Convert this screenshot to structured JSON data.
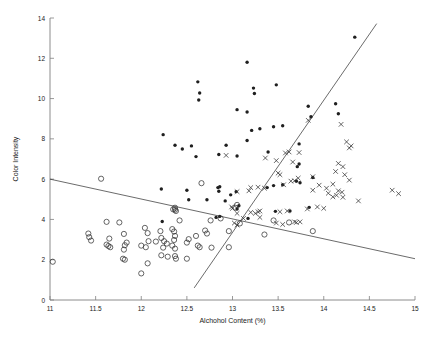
{
  "figure": {
    "background": "#ffffff",
    "axis_color": "#808080",
    "marker_color": "#333333"
  },
  "chart_data": {
    "type": "scatter",
    "title": "",
    "xlabel": "Alchohol Content (%)",
    "ylabel": "Color Intensity",
    "xlim": [
      11,
      15
    ],
    "ylim": [
      0,
      14
    ],
    "xticks": [
      11,
      11.5,
      12,
      12.5,
      13,
      13.5,
      14,
      14.5,
      15
    ],
    "xtick_labels": [
      "11",
      "11.5",
      "12",
      "12.5",
      "13",
      "13.5",
      "14",
      "14.5",
      "15"
    ],
    "yticks": [
      0,
      2,
      4,
      6,
      8,
      10,
      12,
      14
    ],
    "ytick_labels": [
      "0",
      "2",
      "4",
      "6",
      "8",
      "10",
      "12",
      "14"
    ],
    "grid": false,
    "legend": null,
    "series": [
      {
        "name": "class-1-filled-dot",
        "marker": "dot",
        "points": [
          [
            12.85,
            7.22
          ],
          [
            13.05,
            7.15
          ],
          [
            12.24,
            8.21
          ],
          [
            12.62,
            10.83
          ],
          [
            12.64,
            10.28
          ],
          [
            12.63,
            9.93
          ],
          [
            13.16,
            11.8
          ],
          [
            13.05,
            9.45
          ],
          [
            13.16,
            9.33
          ],
          [
            13.23,
            10.52
          ],
          [
            13.24,
            10.25
          ],
          [
            13.48,
            10.68
          ],
          [
            14.34,
            13.05
          ],
          [
            13.83,
            9.62
          ],
          [
            13.86,
            9.1
          ],
          [
            14.13,
            9.74
          ],
          [
            14.16,
            9.25
          ],
          [
            13.73,
            7.75
          ],
          [
            13.16,
            7.92
          ],
          [
            13.39,
            7.35
          ],
          [
            13.21,
            8.42
          ],
          [
            13.3,
            8.5
          ],
          [
            13.45,
            8.6
          ],
          [
            13.55,
            8.65
          ],
          [
            12.37,
            7.68
          ],
          [
            12.45,
            7.5
          ],
          [
            12.55,
            7.65
          ],
          [
            12.6,
            7.12
          ],
          [
            12.93,
            7.68
          ],
          [
            12.22,
            5.51
          ],
          [
            12.5,
            5.45
          ],
          [
            12.52,
            4.98
          ],
          [
            12.72,
            4.98
          ],
          [
            12.85,
            5.4
          ],
          [
            12.84,
            5.58
          ],
          [
            12.86,
            5.62
          ],
          [
            12.92,
            4.92
          ],
          [
            12.98,
            5.22
          ],
          [
            13.04,
            5.38
          ],
          [
            13.38,
            5.58
          ],
          [
            13.45,
            5.68
          ],
          [
            13.55,
            5.72
          ],
          [
            13.74,
            5.82
          ],
          [
            13.7,
            5.9
          ],
          [
            13.71,
            6.62
          ],
          [
            13.73,
            6.75
          ],
          [
            13.88,
            6.08
          ],
          [
            13.84,
            4.6
          ],
          [
            13.63,
            4.42
          ],
          [
            13.47,
            4.4
          ],
          [
            13.17,
            4.05
          ],
          [
            12.82,
            4.1
          ],
          [
            12.86,
            4.15
          ],
          [
            12.23,
            3.9
          ],
          [
            13.07,
            4.68
          ],
          [
            13.05,
            4.52
          ]
        ]
      },
      {
        "name": "class-2-open-circle",
        "marker": "circle",
        "points": [
          [
            11.03,
            1.9
          ],
          [
            11.56,
            6.02
          ],
          [
            11.42,
            3.3
          ],
          [
            11.43,
            3.12
          ],
          [
            11.45,
            2.95
          ],
          [
            11.62,
            3.88
          ],
          [
            11.76,
            3.85
          ],
          [
            11.65,
            3.05
          ],
          [
            11.62,
            2.75
          ],
          [
            11.64,
            2.68
          ],
          [
            11.66,
            2.62
          ],
          [
            11.81,
            3.28
          ],
          [
            11.84,
            2.85
          ],
          [
            11.82,
            2.72
          ],
          [
            11.81,
            2.5
          ],
          [
            11.8,
            2.05
          ],
          [
            11.82,
            2.0
          ],
          [
            12.0,
            1.32
          ],
          [
            12.04,
            3.58
          ],
          [
            12.07,
            3.32
          ],
          [
            12.0,
            2.7
          ],
          [
            12.05,
            2.62
          ],
          [
            12.08,
            2.92
          ],
          [
            12.16,
            2.9
          ],
          [
            12.07,
            1.82
          ],
          [
            12.21,
            3.42
          ],
          [
            12.22,
            3.08
          ],
          [
            12.25,
            2.92
          ],
          [
            12.28,
            2.8
          ],
          [
            12.24,
            2.6
          ],
          [
            12.22,
            2.22
          ],
          [
            12.29,
            2.15
          ],
          [
            12.34,
            3.52
          ],
          [
            12.36,
            3.4
          ],
          [
            12.37,
            3.18
          ],
          [
            12.36,
            2.98
          ],
          [
            12.34,
            2.7
          ],
          [
            12.37,
            2.55
          ],
          [
            12.37,
            2.18
          ],
          [
            12.38,
            2.05
          ],
          [
            12.37,
            4.58
          ],
          [
            12.37,
            4.48
          ],
          [
            12.38,
            4.42
          ],
          [
            12.42,
            3.95
          ],
          [
            12.52,
            3.02
          ],
          [
            12.5,
            2.85
          ],
          [
            12.5,
            2.05
          ],
          [
            12.6,
            3.18
          ],
          [
            12.62,
            2.7
          ],
          [
            12.64,
            2.62
          ],
          [
            12.7,
            3.45
          ],
          [
            12.72,
            3.3
          ],
          [
            12.66,
            5.8
          ],
          [
            12.76,
            3.95
          ],
          [
            12.77,
            2.6
          ],
          [
            12.96,
            2.62
          ],
          [
            12.96,
            3.42
          ],
          [
            13.05,
            4.72
          ],
          [
            13.08,
            3.8
          ],
          [
            13.35,
            3.25
          ],
          [
            13.45,
            3.95
          ],
          [
            13.88,
            3.42
          ],
          [
            13.62,
            3.85
          ],
          [
            12.87,
            4.05
          ],
          [
            13.03,
            4.58
          ],
          [
            12.35,
            4.5
          ]
        ]
      },
      {
        "name": "class-3-x-marker",
        "marker": "x",
        "points": [
          [
            12.93,
            7.18
          ],
          [
            13.36,
            7.05
          ],
          [
            13.48,
            6.92
          ],
          [
            13.58,
            7.3
          ],
          [
            13.62,
            7.35
          ],
          [
            13.66,
            6.85
          ],
          [
            13.73,
            7.32
          ],
          [
            13.83,
            8.92
          ],
          [
            14.19,
            8.72
          ],
          [
            14.25,
            7.85
          ],
          [
            14.3,
            7.65
          ],
          [
            14.28,
            7.55
          ],
          [
            13.5,
            6.3
          ],
          [
            13.52,
            6.22
          ],
          [
            13.56,
            5.72
          ],
          [
            13.64,
            5.9
          ],
          [
            13.68,
            5.92
          ],
          [
            13.72,
            6.05
          ],
          [
            13.88,
            6.12
          ],
          [
            13.95,
            5.7
          ],
          [
            14.03,
            5.55
          ],
          [
            14.1,
            5.75
          ],
          [
            14.13,
            6.38
          ],
          [
            14.16,
            6.78
          ],
          [
            14.21,
            6.62
          ],
          [
            14.23,
            6.22
          ],
          [
            14.28,
            5.95
          ],
          [
            14.2,
            5.35
          ],
          [
            14.05,
            5.3
          ],
          [
            14.1,
            5.12
          ],
          [
            14.14,
            5.2
          ],
          [
            14.16,
            5.42
          ],
          [
            14.21,
            5.1
          ],
          [
            14.38,
            4.92
          ],
          [
            14.75,
            5.45
          ],
          [
            14.82,
            5.28
          ],
          [
            13.88,
            5.45
          ],
          [
            13.93,
            4.62
          ],
          [
            14.0,
            4.55
          ],
          [
            13.82,
            4.52
          ],
          [
            13.6,
            4.42
          ],
          [
            13.52,
            4.38
          ],
          [
            13.3,
            4.42
          ],
          [
            13.25,
            4.3
          ],
          [
            13.28,
            4.38
          ],
          [
            13.2,
            4.35
          ],
          [
            13.05,
            4.3
          ],
          [
            13.18,
            5.42
          ],
          [
            13.28,
            5.6
          ],
          [
            13.05,
            5.38
          ],
          [
            13.2,
            5.58
          ],
          [
            13.35,
            5.55
          ],
          [
            13.12,
            4.05
          ],
          [
            13.3,
            4.1
          ],
          [
            13.02,
            3.82
          ],
          [
            13.05,
            3.72
          ],
          [
            13.48,
            3.82
          ],
          [
            13.55,
            3.75
          ],
          [
            13.68,
            3.88
          ],
          [
            13.7,
            3.85
          ],
          [
            13.74,
            3.88
          ],
          [
            12.99,
            4.62
          ],
          [
            13.0,
            4.55
          ]
        ]
      }
    ],
    "boundary_lines": [
      {
        "name": "descending-boundary",
        "x_start": 11.0,
        "y_start": 6.0,
        "x_end": 15.0,
        "y_end": 2.05
      },
      {
        "name": "ascending-boundary",
        "x_start": 12.58,
        "y_start": 0.6,
        "x_end": 14.58,
        "y_end": 13.72
      }
    ]
  }
}
